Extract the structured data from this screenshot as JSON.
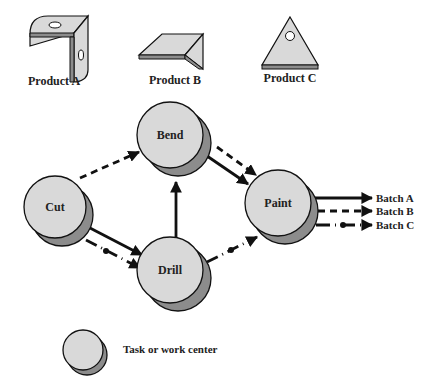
{
  "products": [
    {
      "id": "A",
      "label": "Product A"
    },
    {
      "id": "B",
      "label": "Product B"
    },
    {
      "id": "C",
      "label": "Product C"
    }
  ],
  "nodes": [
    {
      "id": "cut",
      "label": "Cut"
    },
    {
      "id": "bend",
      "label": "Bend"
    },
    {
      "id": "drill",
      "label": "Drill"
    },
    {
      "id": "paint",
      "label": "Paint"
    }
  ],
  "flows": [
    {
      "from": "Cut",
      "to": "Bend",
      "style": "dashed",
      "batch": "B"
    },
    {
      "from": "Cut",
      "to": "Drill",
      "style": "solid",
      "batch": "A"
    },
    {
      "from": "Cut",
      "to": "Drill",
      "style": "dash-dot",
      "batch": "C"
    },
    {
      "from": "Drill",
      "to": "Bend",
      "style": "solid",
      "batch": "A"
    },
    {
      "from": "Bend",
      "to": "Paint",
      "style": "solid",
      "batch": "A"
    },
    {
      "from": "Bend",
      "to": "Paint",
      "style": "dashed",
      "batch": "B"
    },
    {
      "from": "Drill",
      "to": "Paint",
      "style": "dash-dot",
      "batch": "C"
    }
  ],
  "outputs": [
    {
      "label": "Batch A",
      "style": "solid"
    },
    {
      "label": "Batch B",
      "style": "dashed"
    },
    {
      "label": "Batch C",
      "style": "dash-dot"
    }
  ],
  "legend": {
    "label": "Task or work center"
  },
  "colors": {
    "node_fill": "#d9d9d9",
    "node_shadow": "#8c8c8c",
    "stroke": "#111111",
    "product_fill": "#d9d9d9",
    "product_edge": "#8c8c8c"
  }
}
